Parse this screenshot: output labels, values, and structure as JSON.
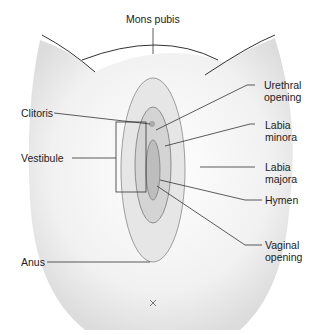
{
  "diagram": {
    "type": "labeled anatomical illustration",
    "labels": {
      "mons_pubis": "Mons pubis",
      "urethral_opening": "Urethral\nopening",
      "clitoris": "Clitoris",
      "labia_minora": "Labia\nminora",
      "vestibule": "Vestibule",
      "labia_majora": "Labia\nmajora",
      "hymen": "Hymen",
      "vaginal_opening": "Vaginal\nopening",
      "anus": "Anus"
    },
    "colors": {
      "line": "#333333",
      "shade": "#d9d9d9",
      "background": "#ffffff"
    }
  }
}
